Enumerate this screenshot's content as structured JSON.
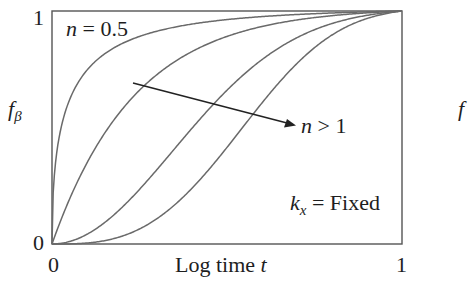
{
  "chart_data": {
    "type": "line",
    "title": "",
    "xlabel": "Log time t",
    "ylabel": "f_β",
    "xlim": [
      0,
      1
    ],
    "ylim": [
      0,
      1
    ],
    "x_ticks": [
      "0",
      "1"
    ],
    "y_ticks": [
      "0",
      "1"
    ],
    "grid": false,
    "legend": null,
    "model": "f = 1 - exp(-K * x^n), K ≈ 4.2",
    "series": [
      {
        "name": "n = 0.5",
        "n": 0.5,
        "x": [
          0,
          0.02,
          0.05,
          0.1,
          0.2,
          0.4,
          0.6,
          0.8,
          1.0
        ],
        "values": [
          0,
          0.45,
          0.61,
          0.74,
          0.85,
          0.93,
          0.96,
          0.98,
          0.99
        ]
      },
      {
        "name": "n = 1",
        "n": 1,
        "x": [
          0,
          0.05,
          0.1,
          0.2,
          0.4,
          0.6,
          0.8,
          1.0
        ],
        "values": [
          0,
          0.19,
          0.34,
          0.57,
          0.81,
          0.92,
          0.97,
          0.99
        ]
      },
      {
        "name": "n = 2",
        "n": 2,
        "x": [
          0,
          0.1,
          0.2,
          0.3,
          0.4,
          0.6,
          0.8,
          1.0
        ],
        "values": [
          0,
          0.04,
          0.15,
          0.31,
          0.49,
          0.78,
          0.93,
          0.99
        ]
      },
      {
        "name": "n = 3",
        "n": 3,
        "x": [
          0,
          0.2,
          0.4,
          0.5,
          0.6,
          0.7,
          0.8,
          1.0
        ],
        "values": [
          0,
          0.03,
          0.24,
          0.41,
          0.6,
          0.76,
          0.88,
          0.99
        ]
      }
    ],
    "annotations": [
      {
        "text": "n = 0.5",
        "position": "top-left"
      },
      {
        "text": "n > 1",
        "type": "arrow",
        "direction": "increasing n, curves shift right"
      },
      {
        "text": "k_x = Fixed",
        "position": "bottom-right"
      }
    ]
  },
  "labels": {
    "y_axis": "f",
    "y_axis_sub": "β",
    "x_axis_main": "Log time ",
    "x_axis_var": "t",
    "y_tick_top": "1",
    "y_tick_bottom": "0",
    "x_tick_left": "0",
    "x_tick_right": "1",
    "annot_n05_var": "n",
    "annot_n05_rest": " = 0.5",
    "annot_ngt1_var": "n",
    "annot_ngt1_rest": " > 1",
    "annot_k_var": "k",
    "annot_k_sub": "x",
    "annot_k_rest": " = Fixed",
    "partial_right_label": "f"
  },
  "colors": {
    "axis": "#555555",
    "curve": "#6a6a6a",
    "arrow": "#222222",
    "text": "#1e1e1e"
  }
}
